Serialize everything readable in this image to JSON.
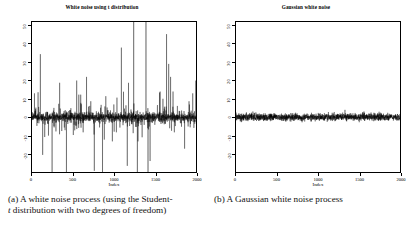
{
  "figure": {
    "panels": [
      {
        "key": "a",
        "title": "White noise using t distribution",
        "caption_line1": "(a)  A white noise process (using the Student-",
        "caption_line2_italic": "t",
        "caption_line2_rest": " distribution with two degrees of freedom)",
        "axis_x_title": "Index"
      },
      {
        "key": "b",
        "title": "Gaussian white noise",
        "caption_line1": "(b)  A Gaussian white noise process",
        "caption_line2_italic": "",
        "caption_line2_rest": "",
        "axis_x_title": "Index"
      }
    ]
  },
  "chart_data": [
    {
      "type": "line",
      "title": "White noise using t distribution",
      "xlabel": "Index",
      "ylabel": "",
      "xlim": [
        0,
        2000
      ],
      "ylim": [
        -30,
        52
      ],
      "xticks": [
        0,
        500,
        1000,
        1500,
        2000
      ],
      "yticks": [
        50,
        40,
        30,
        20,
        10,
        0,
        -10,
        -20
      ],
      "grid": false,
      "legend": "none",
      "line_color": "#000000",
      "description": "Student-t (2 df) white noise, 2000 points, centred on 0 with heavy tails; several spikes exceed the plotted range.",
      "n_points": 2000,
      "distribution": "Student-t",
      "degrees_of_freedom": 2,
      "mean": 0,
      "notable_spikes": [
        {
          "index": 30,
          "value": 13
        },
        {
          "index": 245,
          "value": -42
        },
        {
          "index": 420,
          "value": -38
        },
        {
          "index": 545,
          "value": 20
        },
        {
          "index": 665,
          "value": 22
        },
        {
          "index": 860,
          "value": -35
        },
        {
          "index": 1090,
          "value": 38
        },
        {
          "index": 1240,
          "value": 64
        },
        {
          "index": 1285,
          "value": -40
        },
        {
          "index": 1390,
          "value": 66
        },
        {
          "index": 1415,
          "value": -48
        },
        {
          "index": 1440,
          "value": -24
        },
        {
          "index": 1690,
          "value": 22
        },
        {
          "index": 1720,
          "value": 14
        },
        {
          "index": 1960,
          "value": 13
        }
      ]
    },
    {
      "type": "line",
      "title": "Gaussian white noise",
      "xlabel": "Index",
      "ylabel": "",
      "xlim": [
        0,
        2000
      ],
      "ylim": [
        -30,
        52
      ],
      "xticks": [
        0,
        500,
        1000,
        1500,
        2000
      ],
      "yticks": [
        50,
        40,
        30,
        20,
        10,
        0,
        -10,
        -20
      ],
      "grid": false,
      "legend": "none",
      "line_color": "#000000",
      "description": "Gaussian white noise, 2000 points, mean 0, standard deviation about 1; confined to a narrow band around 0.",
      "n_points": 2000,
      "distribution": "Gaussian",
      "mean": 0,
      "sd": 1,
      "observed_range": [
        -4.0,
        4.2
      ]
    }
  ]
}
